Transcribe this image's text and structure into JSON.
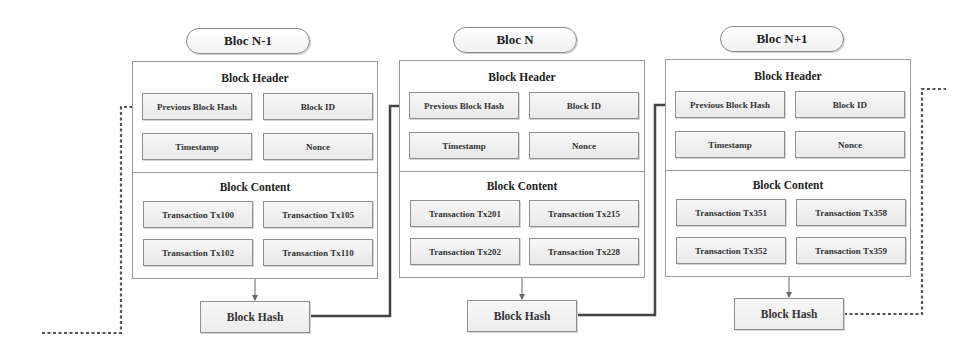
{
  "diagram": {
    "type": "blockchain",
    "blocks": [
      {
        "label": "Bloc N-1",
        "header_title": "Block Header",
        "header_fields": [
          "Previous Block Hash",
          "Block ID",
          "Timestamp",
          "Nonce"
        ],
        "content_title": "Block Content",
        "transactions": [
          "Transaction Tx100",
          "Transaction Tx105",
          "Transaction Tx102",
          "Transaction Tx110"
        ],
        "hash_label": "Block Hash"
      },
      {
        "label": "Bloc N",
        "header_title": "Block Header",
        "header_fields": [
          "Previous Block Hash",
          "Block ID",
          "Timestamp",
          "Nonce"
        ],
        "content_title": "Block Content",
        "transactions": [
          "Transaction Tx201",
          "Transaction Tx215",
          "Transaction Tx202",
          "Transaction Tx228"
        ],
        "hash_label": "Block Hash"
      },
      {
        "label": "Bloc N+1",
        "header_title": "Block Header",
        "header_fields": [
          "Previous Block Hash",
          "Block ID",
          "Timestamp",
          "Nonce"
        ],
        "content_title": "Block Content",
        "transactions": [
          "Transaction Tx351",
          "Transaction Tx358",
          "Transaction Tx352",
          "Transaction Tx359"
        ],
        "hash_label": "Block Hash"
      }
    ],
    "connections": [
      {
        "from": "previous (off-screen)",
        "to": "Bloc N-1.Previous Block Hash",
        "style": "dotted"
      },
      {
        "from": "Bloc N-1.Block Hash",
        "to": "Bloc N.Previous Block Hash",
        "style": "solid"
      },
      {
        "from": "Bloc N.Block Hash",
        "to": "Bloc N+1.Previous Block Hash",
        "style": "solid"
      },
      {
        "from": "Bloc N+1.Block Hash",
        "to": "next (off-screen)",
        "style": "dotted"
      }
    ],
    "colors": {
      "line": "#444444",
      "border": "#8f8f8f",
      "box_fill": "#eeeeee"
    }
  }
}
